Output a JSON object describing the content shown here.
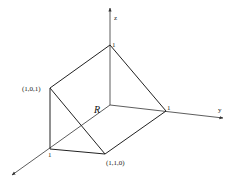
{
  "diagram": {
    "type": "3d-solid-region",
    "axes": {
      "x": {
        "label": ""
      },
      "y": {
        "label": "y"
      },
      "z": {
        "label": "z"
      }
    },
    "region_label": "R",
    "vertex_labels": {
      "z_intercept": "1",
      "y_intercept": "1",
      "x_intercept": "1",
      "p101": "(1,0,1)",
      "p110": "(1,1,0)"
    },
    "colors": {
      "line": "#222222",
      "axis": "#333333",
      "background": "#ffffff"
    }
  }
}
